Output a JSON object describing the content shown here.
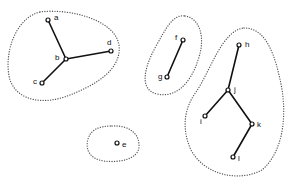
{
  "diagram": {
    "type": "cluster-graph",
    "clusters": [
      {
        "id": "cluster-1",
        "nodes": [
          "a",
          "b",
          "c",
          "d"
        ],
        "path": "M 40 12 C 70 8, 115 20, 119 45 C 122 70, 95 85, 70 95 C 45 105, 18 102, 10 80 C 3 55, 15 18, 40 12 Z"
      },
      {
        "id": "cluster-2",
        "nodes": [
          "f",
          "g"
        ],
        "path": "M 185 16 C 200 18, 206 38, 198 60 C 190 85, 175 98, 157 94 C 140 90, 143 70, 155 48 C 166 28, 173 14, 185 16 Z"
      },
      {
        "id": "cluster-3",
        "nodes": [
          "h",
          "i",
          "j",
          "k",
          "l"
        ],
        "path": "M 244 28 C 262 28, 272 45, 279 75 C 288 110, 285 150, 262 170 C 240 182, 205 176, 191 150 C 182 130, 183 110, 196 92 C 210 72, 222 30, 244 28 Z"
      },
      {
        "id": "cluster-4",
        "nodes": [
          "e"
        ],
        "path": "M 112 126 C 128 125, 140 133, 139 147 C 138 159, 120 163, 104 161 C 90 159, 85 150, 88 139 C 91 129, 100 126, 112 126 Z"
      }
    ],
    "nodes": [
      {
        "id": "a",
        "label": "a",
        "x": 48,
        "y": 20,
        "lx": 54,
        "ly": 20
      },
      {
        "id": "b",
        "label": "b",
        "x": 66,
        "y": 59,
        "lx": 55,
        "ly": 60
      },
      {
        "id": "c",
        "label": "c",
        "x": 42,
        "y": 83,
        "lx": 33,
        "ly": 84
      },
      {
        "id": "d",
        "label": "d",
        "x": 111,
        "y": 51,
        "lx": 107,
        "ly": 45
      },
      {
        "id": "e",
        "label": "e",
        "x": 117,
        "y": 143,
        "lx": 122,
        "ly": 147
      },
      {
        "id": "f",
        "label": "f",
        "x": 183,
        "y": 40,
        "lx": 175,
        "ly": 40
      },
      {
        "id": "g",
        "label": "g",
        "x": 167,
        "y": 77,
        "lx": 158,
        "ly": 79
      },
      {
        "id": "h",
        "label": "h",
        "x": 239,
        "y": 45,
        "lx": 245,
        "ly": 47
      },
      {
        "id": "i",
        "label": "i",
        "x": 205,
        "y": 116,
        "lx": 200,
        "ly": 124
      },
      {
        "id": "j",
        "label": "j",
        "x": 228,
        "y": 90,
        "lx": 234,
        "ly": 92
      },
      {
        "id": "k",
        "label": "k",
        "x": 252,
        "y": 124,
        "lx": 257,
        "ly": 127
      },
      {
        "id": "l",
        "label": "l",
        "x": 233,
        "y": 157,
        "lx": 238,
        "ly": 161
      }
    ],
    "edges": [
      [
        "a",
        "b"
      ],
      [
        "c",
        "b"
      ],
      [
        "b",
        "d"
      ],
      [
        "f",
        "g"
      ],
      [
        "h",
        "j"
      ],
      [
        "j",
        "i"
      ],
      [
        "j",
        "k"
      ],
      [
        "k",
        "l"
      ]
    ],
    "colors": {
      "edge": "#111111",
      "cluster": "#555555",
      "background": "#ffffff"
    }
  }
}
